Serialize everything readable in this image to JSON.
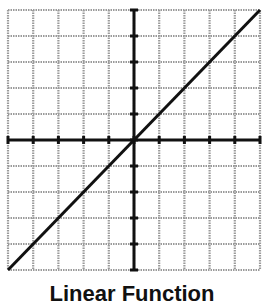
{
  "graph": {
    "grid": {
      "left": 8,
      "top": 10,
      "right": 260,
      "bottom": 270,
      "cols": 10,
      "rows": 10,
      "grid_color": "#9a9a9a",
      "axis_color": "#111111"
    },
    "function": {
      "type": "linear",
      "slope": 1,
      "intercept": 0,
      "line_color": "#111111"
    }
  },
  "caption": {
    "text": "Linear Function"
  }
}
